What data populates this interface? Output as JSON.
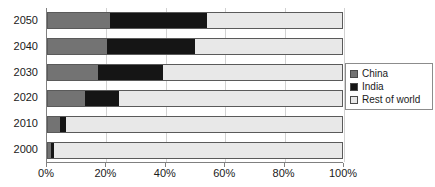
{
  "chart_data": {
    "type": "bar",
    "orientation": "horizontal",
    "stacked": true,
    "stack_mode": "percent",
    "title": "",
    "subtitle": "",
    "xlabel": "",
    "ylabel": "",
    "categories": [
      "2000",
      "2010",
      "2020",
      "2030",
      "2040",
      "2050"
    ],
    "category_order_top_to_bottom": [
      "2050",
      "2040",
      "2030",
      "2020",
      "2010",
      "2000"
    ],
    "series": [
      {
        "name": "China",
        "color": "#737373",
        "values": [
          1,
          4,
          12.5,
          17,
          20,
          21
        ]
      },
      {
        "name": "India",
        "color": "#151515",
        "values": [
          1,
          2,
          11.5,
          22,
          30,
          33
        ]
      },
      {
        "name": "Rest of world",
        "color": "#e8e8e8",
        "values": [
          98,
          94,
          76,
          61,
          50,
          46
        ]
      }
    ],
    "xlim": [
      0,
      100
    ],
    "xticks": [
      0,
      20,
      40,
      60,
      80,
      100
    ],
    "xtick_labels": [
      "0%",
      "20%",
      "40%",
      "60%",
      "80%",
      "100%"
    ],
    "grid": true,
    "grid_axis": "x",
    "legend_position": "right"
  },
  "legend": {
    "items": [
      {
        "label": "China",
        "color": "#737373"
      },
      {
        "label": "India",
        "color": "#151515"
      },
      {
        "label": "Rest of world",
        "color": "#e8e8e8"
      }
    ]
  },
  "colors": {
    "china": "#737373",
    "india": "#151515",
    "rest_of_world": "#e8e8e8",
    "axis": "#808080",
    "grid": "#d2d2d2",
    "text": "#1a1a1a"
  }
}
